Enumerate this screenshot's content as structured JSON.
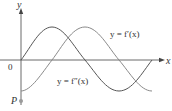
{
  "figure": {
    "axes": {
      "x_label": "x",
      "y_label": "y",
      "origin_label": "0"
    },
    "point": {
      "label": "P"
    },
    "curves": [
      {
        "id": "f-prime",
        "label": "y = f′(x)",
        "shape": "sine starting at origin, amplitude ~33px, period ~131px",
        "color": "#555555"
      },
      {
        "id": "f-double-prime",
        "label": "y = f″(x)",
        "shape": "negative cosine starting at -amplitude",
        "color": "#888888"
      }
    ],
    "colors": {
      "axis": "#333333",
      "curve_dark": "#555555",
      "curve_light": "#8a8a8a",
      "point": "#888888"
    }
  }
}
